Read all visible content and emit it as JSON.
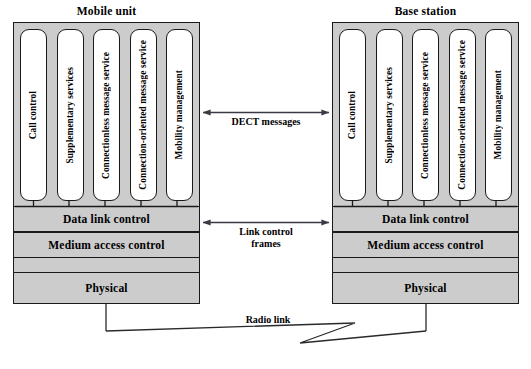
{
  "diagram": {
    "type": "layered-protocol-architecture",
    "colors": {
      "fill_gray": "#cccccc",
      "pill_fill": "#ffffff",
      "stroke": "#1a1a1a",
      "background": "#ffffff"
    },
    "units": [
      {
        "id": "mobile-unit",
        "title": "Mobile unit",
        "entities": [
          {
            "label": "Call control",
            "lines": 1
          },
          {
            "label": "Supplementary services",
            "lines": 1
          },
          {
            "label": "Connectionless message service",
            "lines": 1
          },
          {
            "label": "Connection-oriented message service",
            "lines": 2
          },
          {
            "label": "Mobility management",
            "lines": 1
          }
        ],
        "layers": [
          "Data link control",
          "Medium access control",
          "Physical"
        ]
      },
      {
        "id": "base-station",
        "title": "Base station",
        "entities": [
          {
            "label": "Call control",
            "lines": 1
          },
          {
            "label": "Supplementary services",
            "lines": 1
          },
          {
            "label": "Connectionless message service",
            "lines": 1
          },
          {
            "label": "Connection-oriented message service",
            "lines": 2
          },
          {
            "label": "Mobility management",
            "lines": 1
          }
        ],
        "layers": [
          "Data link control",
          "Medium access control",
          "Physical"
        ]
      }
    ],
    "connections": [
      {
        "id": "dect-messages",
        "label": "DECT messages",
        "style": "double-headed-arrow",
        "level": "application-entities"
      },
      {
        "id": "link-control-frames",
        "label": "Link control\nframes",
        "style": "double-headed-arrow",
        "level": "data-link-control"
      },
      {
        "id": "radio-link",
        "label": "Radio link",
        "style": "lightning-bolt",
        "level": "physical"
      }
    ]
  }
}
